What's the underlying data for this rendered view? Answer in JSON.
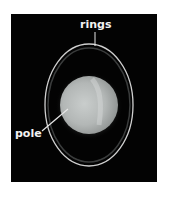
{
  "figure": {
    "labels": {
      "rings": "rings",
      "pole": "pole"
    },
    "colors": {
      "background": "#030303",
      "ring": "#cfcfcf",
      "planet": "#b8bcbc",
      "label": "#f2f2f2"
    }
  }
}
